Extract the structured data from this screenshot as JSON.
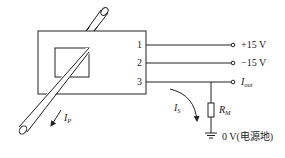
{
  "diagram": {
    "type": "current-sensor-wiring",
    "pins": [
      {
        "label": "1",
        "terminal_label": "+15 V"
      },
      {
        "label": "2",
        "terminal_label": "−15 V"
      },
      {
        "label": "3",
        "terminal_label_main": "I",
        "terminal_label_sub": "out"
      }
    ],
    "primary_current": {
      "main": "I",
      "sub": "P"
    },
    "secondary_current": {
      "main": "I",
      "sub": "S"
    },
    "resistor": {
      "main": "R",
      "sub": "M"
    },
    "ground_label": "0 V(电源地)"
  }
}
